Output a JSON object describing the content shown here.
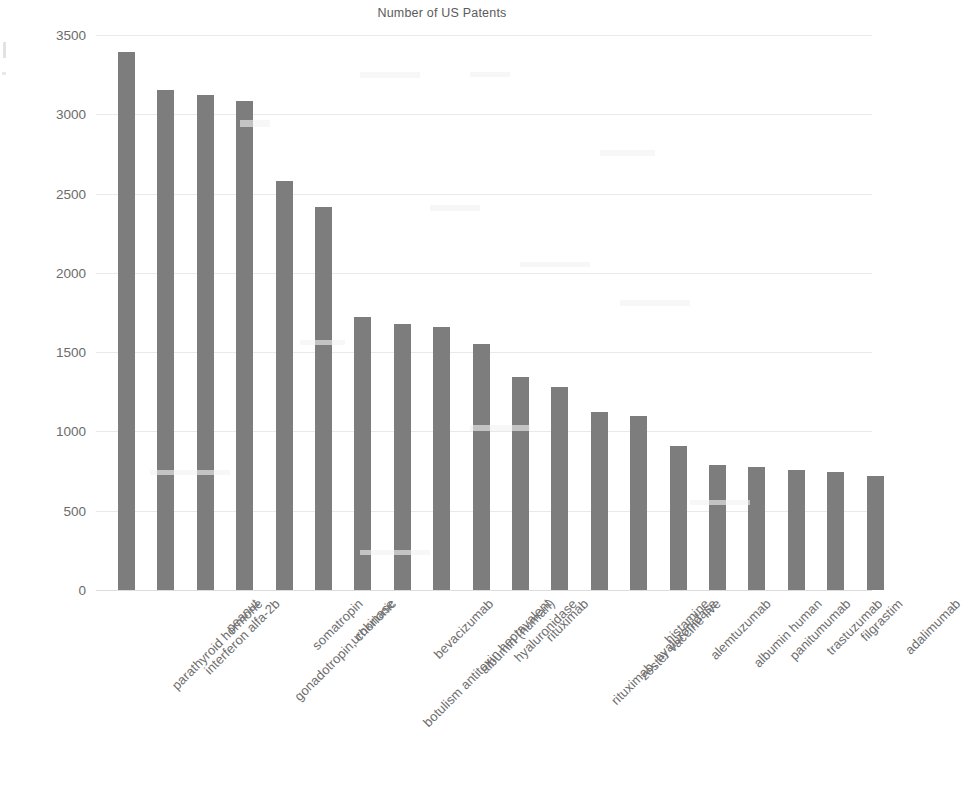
{
  "chart_data": {
    "type": "bar",
    "title": "Number of US Patents",
    "xlabel": "",
    "ylabel": "",
    "ylim": [
      0,
      3500
    ],
    "ytick_step": 500,
    "yticks": [
      3500,
      3000,
      2500,
      2000,
      1500,
      1000,
      500,
      0
    ],
    "grid": true,
    "legend": false,
    "bar_color": "#7d7d7d",
    "categories": [
      "parathyroid hormone",
      "interferon alfa-2b",
      "peanut",
      "gonadotropin, chorionic",
      "somatropin",
      "urokinase",
      "botulism antitoxin heptavalent",
      "bevacizumab",
      "albumin (human)",
      "hyaluronidase",
      "rituximab",
      "rituximab, hyaluronidase",
      "zoster vaccine live",
      "histamine",
      "alemtuzumab",
      "albumin human",
      "panitumumab",
      "trastuzumab",
      "filgrastim",
      "adalimumab"
    ],
    "values": [
      3395,
      3155,
      3120,
      3085,
      2580,
      2415,
      1720,
      1675,
      1660,
      1550,
      1345,
      1280,
      1125,
      1100,
      910,
      790,
      775,
      755,
      745,
      720
    ]
  }
}
